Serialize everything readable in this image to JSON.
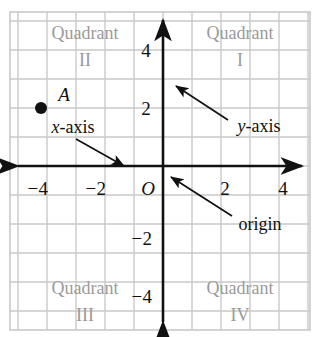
{
  "figure": {
    "type": "coordinate-plane-diagram",
    "background_color": "#ffffff",
    "grid": {
      "visible": true,
      "color": "#c9c9c9",
      "cell_size_px": 29,
      "x_range_px": [
        10,
        310
      ],
      "y_range_px": [
        12,
        330
      ]
    },
    "axes": {
      "color": "#111111",
      "origin_px": {
        "x": 163,
        "y": 166
      },
      "unit_px": 29,
      "x_axis": {
        "label": "x-axis",
        "arrow_both_ends": true
      },
      "y_axis": {
        "label": "y-axis",
        "arrow_both_ends": true
      }
    }
  },
  "ticks": {
    "x": [
      {
        "label": "−4",
        "value": -4,
        "x": 38,
        "y": 188
      },
      {
        "label": "−2",
        "value": -2,
        "x": 96,
        "y": 188
      },
      {
        "label": "2",
        "value": 2,
        "x": 225,
        "y": 188
      },
      {
        "label": "4",
        "value": 4,
        "x": 283,
        "y": 188
      }
    ],
    "y": [
      {
        "label": "4",
        "value": 4,
        "x": 146,
        "y": 50
      },
      {
        "label": "2",
        "value": 2,
        "x": 146,
        "y": 108
      },
      {
        "label": "−2",
        "value": -2,
        "x": 142,
        "y": 238
      },
      {
        "label": "−4",
        "value": -4,
        "x": 142,
        "y": 296
      }
    ],
    "origin_label": {
      "label": "O",
      "x": 148,
      "y": 188
    }
  },
  "quadrants": [
    {
      "name": "quadrant-1",
      "word": "Quadrant",
      "numeral": "I",
      "word_x": 240,
      "word_y": 33,
      "num_x": 240,
      "num_y": 60
    },
    {
      "name": "quadrant-2",
      "word": "Quadrant",
      "numeral": "II",
      "word_x": 85,
      "word_y": 33,
      "num_x": 85,
      "num_y": 60
    },
    {
      "name": "quadrant-3",
      "word": "Quadrant",
      "numeral": "III",
      "word_x": 85,
      "word_y": 288,
      "num_x": 85,
      "num_y": 315
    },
    {
      "name": "quadrant-4",
      "word": "Quadrant",
      "numeral": "IV",
      "word_x": 240,
      "word_y": 288,
      "num_x": 240,
      "num_y": 315
    }
  ],
  "points": [
    {
      "name": "point-a",
      "label": "A",
      "coordinates": {
        "x": -4,
        "y": 2
      },
      "px": {
        "x": 41,
        "y": 108
      },
      "label_px": {
        "x": 64,
        "y": 94
      },
      "dot_radius_px": 6,
      "color": "#111111"
    }
  ],
  "annotations": [
    {
      "name": "x-axis-annotation",
      "text_prefix": "x",
      "text_suffix": "-axis",
      "text_x": 73,
      "text_y": 127,
      "arrow_from": {
        "x": 76,
        "y": 139
      },
      "arrow_to": {
        "x": 124,
        "y": 166
      }
    },
    {
      "name": "y-axis-annotation",
      "text_prefix": "y",
      "text_suffix": "-axis",
      "text_x": 259,
      "text_y": 126,
      "arrow_from": {
        "x": 228,
        "y": 120
      },
      "arrow_to": {
        "x": 176,
        "y": 86
      }
    },
    {
      "name": "origin-annotation",
      "text_prefix": "",
      "text_suffix": "origin",
      "text_x": 260,
      "text_y": 224,
      "arrow_from": {
        "x": 232,
        "y": 216
      },
      "arrow_to": {
        "x": 171,
        "y": 177
      }
    }
  ],
  "colors": {
    "grid": "#c9c9c9",
    "axis": "#111111",
    "quadrant_text": "#9a9a9a",
    "label_text": "#111111",
    "background": "#ffffff"
  }
}
